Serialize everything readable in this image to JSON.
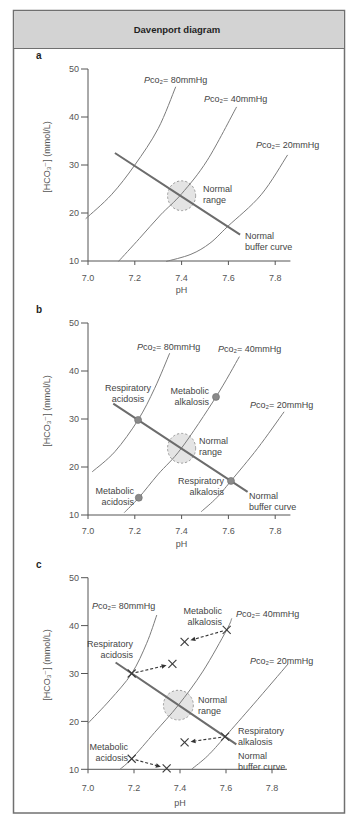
{
  "figure": {
    "title": "Davenport diagram"
  },
  "chart_data": [
    {
      "type": "line",
      "panel": "a",
      "title": "",
      "xlabel": "pH",
      "ylabel": "[HCO₃⁻] (mmol/L)",
      "xlim": [
        7.0,
        7.865
      ],
      "ylim": [
        10,
        50
      ],
      "xticks": [
        7.0,
        7.2,
        7.4,
        7.6,
        7.8
      ],
      "xtick_labels": [
        "7.0",
        "7.2",
        "7.4",
        "7.6",
        "7.8"
      ],
      "yticks": [
        10,
        20,
        30,
        40,
        50
      ],
      "ytick_labels": [
        "10",
        "20",
        "30",
        "40",
        "50"
      ],
      "grid": false,
      "series": [
        {
          "pco2_mmHg": 80,
          "label": {
            "italic": "P",
            "rest": "co₂= 80mmHg"
          },
          "points": [
            [
              6.99,
              18.8
            ],
            [
              7.1,
              23.8
            ],
            [
              7.2,
              30.0
            ],
            [
              7.3,
              37.6
            ],
            [
              7.375,
              46.3
            ]
          ]
        },
        {
          "pco2_mmHg": 40,
          "label": {
            "italic": "P",
            "rest": "co₂= 40mmHg"
          },
          "points": [
            [
              7.13,
              9.9
            ],
            [
              7.22,
              14.7
            ],
            [
              7.31,
              19.6
            ],
            [
              7.4,
              24.0
            ],
            [
              7.51,
              31.0
            ],
            [
              7.635,
              42.1
            ]
          ]
        },
        {
          "pco2_mmHg": 20,
          "label": {
            "italic": "P",
            "rest": "co₂= 20mmHg"
          },
          "points": [
            [
              7.334,
              9.9
            ],
            [
              7.44,
              11.4
            ],
            [
              7.521,
              13.7
            ],
            [
              7.597,
              17.2
            ],
            [
              7.74,
              23.8
            ],
            [
              7.853,
              32.1
            ]
          ]
        }
      ],
      "buffer_curve": {
        "label": [
          "Normal",
          "buffer curve"
        ],
        "points": [
          [
            7.115,
            32.5
          ],
          [
            7.65,
            15.5
          ]
        ]
      },
      "normal_range": {
        "label": [
          "Normal",
          "range"
        ],
        "ph_range": [
          7.34,
          7.46
        ],
        "hco3_range": [
          20.5,
          26.7
        ]
      },
      "markers": []
    },
    {
      "type": "line",
      "panel": "b",
      "title": "",
      "xlabel": "pH",
      "ylabel": "[HCO₃⁻] (mmol/L)",
      "xlim": [
        7.0,
        7.865
      ],
      "ylim": [
        10,
        50
      ],
      "xticks": [
        7.0,
        7.2,
        7.4,
        7.6,
        7.8
      ],
      "xtick_labels": [
        "7.0",
        "7.2",
        "7.4",
        "7.6",
        "7.8"
      ],
      "yticks": [
        10,
        20,
        30,
        40,
        50
      ],
      "ytick_labels": [
        "10",
        "20",
        "30",
        "40",
        "50"
      ],
      "grid": false,
      "series": [
        {
          "pco2_mmHg": 80,
          "label": {
            "italic": "P",
            "rest": "co₂= 80mmHg"
          },
          "points": [
            [
              7.018,
              19.0
            ],
            [
              7.115,
              23.2
            ],
            [
              7.214,
              29.8
            ],
            [
              7.285,
              36.4
            ],
            [
              7.349,
              43.7
            ]
          ]
        },
        {
          "pco2_mmHg": 40,
          "label": {
            "italic": "P",
            "rest": "co₂= 40mmHg"
          },
          "points": [
            [
              7.155,
              10.5
            ],
            [
              7.217,
              13.6
            ],
            [
              7.3,
              18.5
            ],
            [
              7.399,
              23.9
            ],
            [
              7.547,
              34.6
            ],
            [
              7.647,
              43.0
            ]
          ]
        },
        {
          "pco2_mmHg": 20,
          "label": {
            "italic": "P",
            "rest": "co₂= 20mmHg"
          },
          "points": [
            [
              7.484,
              10.7
            ],
            [
              7.55,
              13.6
            ],
            [
              7.611,
              17.1
            ],
            [
              7.725,
              23.9
            ],
            [
              7.838,
              31.5
            ]
          ]
        }
      ],
      "buffer_curve": {
        "label": [
          "Normal",
          "buffer curve"
        ],
        "points": [
          [
            7.108,
            33.2
          ],
          [
            7.682,
            14.8
          ]
        ]
      },
      "normal_range": {
        "label": [
          "Normal",
          "range"
        ],
        "ph_range": [
          7.34,
          7.46
        ],
        "hco3_range": [
          20.8,
          27.0
        ]
      },
      "markers": [
        {
          "style": "dot",
          "label": [
            "Respiratory",
            "acidosis"
          ],
          "ph": 7.214,
          "hco3": 29.8
        },
        {
          "style": "dot",
          "label": [
            "Metabolic",
            "alkalosis"
          ],
          "ph": 7.547,
          "hco3": 34.6
        },
        {
          "style": "dot",
          "label": [
            "Respiratory",
            "alkalosis"
          ],
          "ph": 7.611,
          "hco3": 17.1
        },
        {
          "style": "dot",
          "label": [
            "Metabolic",
            "acidosis"
          ],
          "ph": 7.217,
          "hco3": 13.6
        }
      ]
    },
    {
      "type": "line",
      "panel": "c",
      "title": "",
      "xlabel": "pH",
      "ylabel": "[HCO₃⁻] (mmol/L)",
      "xlim": [
        7.0,
        7.865
      ],
      "ylim": [
        10,
        50
      ],
      "xticks": [
        7.0,
        7.2,
        7.4,
        7.6,
        7.8
      ],
      "xtick_labels": [
        "7.0",
        "7.2",
        "7.4",
        "7.6",
        "7.8"
      ],
      "yticks": [
        10,
        20,
        30,
        40,
        50
      ],
      "ytick_labels": [
        "10",
        "20",
        "30",
        "40",
        "50"
      ],
      "grid": false,
      "series": [
        {
          "pco2_mmHg": 80,
          "label": {
            "italic": "P",
            "rest": "co₂= 80mmHg"
          },
          "points": [
            [
              7.0,
              19.6
            ],
            [
              7.096,
              24.5
            ],
            [
              7.19,
              30.0
            ],
            [
              7.255,
              36.3
            ],
            [
              7.299,
              42.2
            ]
          ]
        },
        {
          "pco2_mmHg": 40,
          "label": {
            "italic": "P",
            "rest": "co₂= 40mmHg"
          },
          "points": [
            [
              7.139,
              10.0
            ],
            [
              7.19,
              12.2
            ],
            [
              7.29,
              17.7
            ],
            [
              7.393,
              23.4
            ],
            [
              7.5,
              30.5
            ],
            [
              7.603,
              39.1
            ],
            [
              7.625,
              41.5
            ]
          ]
        },
        {
          "pco2_mmHg": 20,
          "label": {
            "italic": "P",
            "rest": "co₂= 20mmHg"
          },
          "points": [
            [
              7.45,
              10.0
            ],
            [
              7.52,
              12.8
            ],
            [
              7.596,
              16.8
            ],
            [
              7.72,
              23.6
            ],
            [
              7.87,
              32.0
            ]
          ]
        }
      ],
      "buffer_curve": {
        "label": [
          "Normal",
          "buffer curve"
        ],
        "points": [
          [
            7.12,
            32.3
          ],
          [
            7.645,
            15.2
          ]
        ]
      },
      "normal_range": {
        "label": [
          "Normal",
          "range"
        ],
        "ph_range": [
          7.328,
          7.458
        ],
        "hco3_range": [
          20.3,
          26.5
        ]
      },
      "markers": [
        {
          "style": "cross",
          "label": [
            "Respiratory",
            "acidosis"
          ],
          "ph": 7.19,
          "hco3": 30.0,
          "compensated_to": [
            7.367,
            32.0
          ]
        },
        {
          "style": "cross",
          "label": [
            "Metabolic",
            "alkalosis"
          ],
          "ph": 7.603,
          "hco3": 39.1,
          "compensated_to": [
            7.42,
            36.6
          ]
        },
        {
          "style": "cross",
          "label": [
            "Respiratory",
            "alkalosis"
          ],
          "ph": 7.596,
          "hco3": 16.8,
          "compensated_to": [
            7.42,
            15.6
          ]
        },
        {
          "style": "cross",
          "label": [
            "Metabolic",
            "acidosis"
          ],
          "ph": 7.19,
          "hco3": 12.2,
          "compensated_to": [
            7.342,
            10.2
          ]
        }
      ]
    }
  ]
}
